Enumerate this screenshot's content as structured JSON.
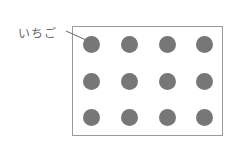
{
  "figure": {
    "label": "いちご",
    "item_color": "#777777",
    "border_color": "#9a9a9a",
    "rows": 3,
    "columns": 4,
    "count": 12
  }
}
